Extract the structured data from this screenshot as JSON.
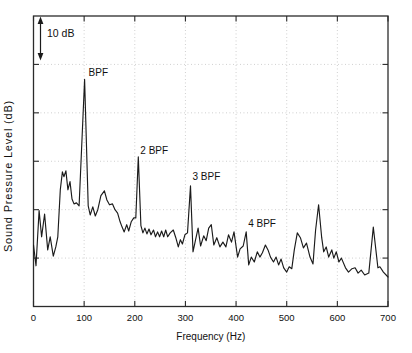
{
  "figure": {
    "background": "#ffffff",
    "scale_bar_label": "10 dB"
  },
  "chart_data": {
    "type": "line",
    "title": "",
    "xlabel": "Frequency (Hz)",
    "ylabel": "Sound Pressure Level (dB)",
    "xlim": [
      0,
      700
    ],
    "x_ticks": [
      0,
      100,
      200,
      300,
      400,
      500,
      600,
      700
    ],
    "y_axis_numeric_labels": "none (relative scale, 10 dB reference bar shown)",
    "ylim_rel_db": [
      0,
      60
    ],
    "y_tick_step_db": 10,
    "grid": "dotted",
    "legend": "none",
    "line_color": "#1b1b1b",
    "grid_color": "#bcbcbc",
    "scale_bar": {
      "label": "10 dB",
      "span_db": 10
    },
    "peaks": [
      {
        "label": "BPF",
        "freq_hz": 101,
        "level_rel_db": 46.9
      },
      {
        "label": "2 BPF",
        "freq_hz": 207,
        "level_rel_db": 30.9
      },
      {
        "label": "3 BPF",
        "freq_hz": 310,
        "level_rel_db": 24.9
      },
      {
        "label": "4 BPF",
        "freq_hz": 420,
        "level_rel_db": 15.4
      }
    ],
    "unlabeled_peaks": [
      {
        "freq_hz": 563,
        "level_rel_db": 21.0
      },
      {
        "freq_hz": 671,
        "level_rel_db": 16.4
      }
    ],
    "series": [
      {
        "name": "sound-pressure-spectrum",
        "points": [
          [
            0,
            12.7
          ],
          [
            5,
            8.4
          ],
          [
            11,
            19.8
          ],
          [
            16,
            14.4
          ],
          [
            22,
            19.1
          ],
          [
            28,
            11.7
          ],
          [
            33,
            14.4
          ],
          [
            39,
            10.4
          ],
          [
            44,
            12.3
          ],
          [
            48,
            14.4
          ],
          [
            53,
            24.1
          ],
          [
            57,
            27.8
          ],
          [
            60,
            26.8
          ],
          [
            64,
            28.0
          ],
          [
            68,
            24.1
          ],
          [
            72,
            25.8
          ],
          [
            76,
            22.2
          ],
          [
            80,
            21.2
          ],
          [
            85,
            21.4
          ],
          [
            90,
            20.8
          ],
          [
            101,
            46.9
          ],
          [
            108,
            20.8
          ],
          [
            112,
            18.9
          ],
          [
            117,
            20.6
          ],
          [
            122,
            18.7
          ],
          [
            127,
            20.0
          ],
          [
            133,
            22.9
          ],
          [
            140,
            23.9
          ],
          [
            145,
            22.0
          ],
          [
            150,
            21.0
          ],
          [
            156,
            21.2
          ],
          [
            161,
            20.0
          ],
          [
            166,
            19.3
          ],
          [
            171,
            17.5
          ],
          [
            175,
            16.4
          ],
          [
            179,
            15.4
          ],
          [
            184,
            16.9
          ],
          [
            188,
            15.6
          ],
          [
            193,
            17.5
          ],
          [
            198,
            18.3
          ],
          [
            202,
            18.3
          ],
          [
            207,
            30.9
          ],
          [
            212,
            16.7
          ],
          [
            216,
            15.2
          ],
          [
            220,
            16.2
          ],
          [
            224,
            15.0
          ],
          [
            228,
            16.0
          ],
          [
            232,
            14.8
          ],
          [
            237,
            15.8
          ],
          [
            241,
            14.4
          ],
          [
            245,
            15.4
          ],
          [
            249,
            14.4
          ],
          [
            253,
            15.6
          ],
          [
            257,
            14.4
          ],
          [
            261,
            15.8
          ],
          [
            265,
            14.4
          ],
          [
            270,
            15.2
          ],
          [
            276,
            15.8
          ],
          [
            281,
            14.2
          ],
          [
            286,
            12.3
          ],
          [
            290,
            13.8
          ],
          [
            294,
            12.9
          ],
          [
            299,
            14.8
          ],
          [
            304,
            15.2
          ],
          [
            310,
            24.9
          ],
          [
            315,
            11.3
          ],
          [
            320,
            13.8
          ],
          [
            325,
            16.2
          ],
          [
            330,
            12.5
          ],
          [
            336,
            14.6
          ],
          [
            341,
            13.6
          ],
          [
            346,
            16.2
          ],
          [
            351,
            16.9
          ],
          [
            356,
            12.7
          ],
          [
            362,
            14.2
          ],
          [
            368,
            12.3
          ],
          [
            374,
            13.3
          ],
          [
            380,
            12.3
          ],
          [
            385,
            14.8
          ],
          [
            391,
            13.3
          ],
          [
            396,
            15.4
          ],
          [
            403,
            10.2
          ],
          [
            408,
            11.9
          ],
          [
            414,
            12.5
          ],
          [
            420,
            15.4
          ],
          [
            425,
            8.6
          ],
          [
            430,
            10.2
          ],
          [
            436,
            9.2
          ],
          [
            442,
            11.3
          ],
          [
            447,
            10.2
          ],
          [
            452,
            11.1
          ],
          [
            458,
            12.7
          ],
          [
            463,
            11.7
          ],
          [
            468,
            10.2
          ],
          [
            474,
            9.2
          ],
          [
            479,
            10.2
          ],
          [
            484,
            8.6
          ],
          [
            489,
            9.8
          ],
          [
            494,
            8.0
          ],
          [
            500,
            7.1
          ],
          [
            505,
            8.2
          ],
          [
            510,
            7.8
          ],
          [
            515,
            11.7
          ],
          [
            521,
            15.2
          ],
          [
            527,
            14.2
          ],
          [
            533,
            12.1
          ],
          [
            539,
            13.1
          ],
          [
            546,
            10.2
          ],
          [
            552,
            8.8
          ],
          [
            557,
            15.8
          ],
          [
            563,
            21.0
          ],
          [
            569,
            14.2
          ],
          [
            573,
            11.3
          ],
          [
            578,
            12.3
          ],
          [
            583,
            10.2
          ],
          [
            589,
            11.7
          ],
          [
            593,
            10.0
          ],
          [
            598,
            11.3
          ],
          [
            603,
            9.2
          ],
          [
            608,
            10.0
          ],
          [
            616,
            8.0
          ],
          [
            622,
            7.1
          ],
          [
            629,
            7.8
          ],
          [
            635,
            8.0
          ],
          [
            641,
            6.9
          ],
          [
            647,
            7.5
          ],
          [
            654,
            6.5
          ],
          [
            662,
            6.9
          ],
          [
            671,
            16.4
          ],
          [
            680,
            8.0
          ],
          [
            684,
            8.2
          ],
          [
            691,
            7.1
          ],
          [
            700,
            6.1
          ]
        ]
      }
    ]
  }
}
